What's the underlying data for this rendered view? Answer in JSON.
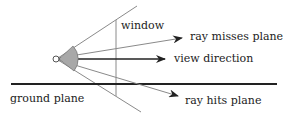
{
  "diagram": {
    "title": "",
    "labels": {
      "window": "window",
      "ray_misses": "ray misses plane",
      "view_direction": "view direction",
      "ground_plane": "ground plane",
      "ray_hits": "ray hits plane"
    },
    "colors": {
      "line": "#222222",
      "thin_line": "#8a8a8a",
      "fan_fill": "#a8a8a8",
      "background": "#ffffff"
    }
  }
}
